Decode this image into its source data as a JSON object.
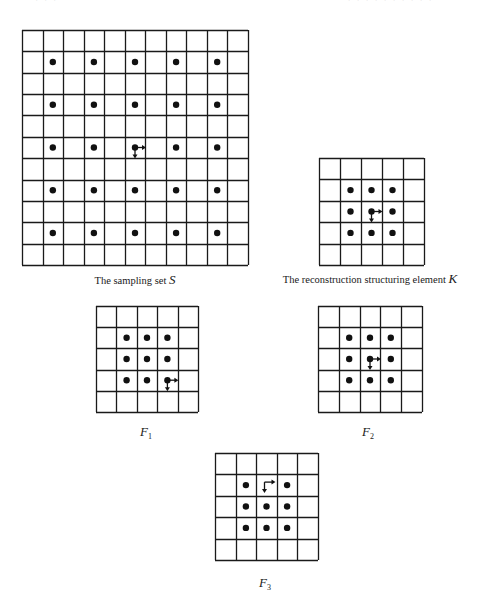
{
  "page_header": {
    "left_fragment": "· · ·",
    "right_fragment": "· · · · · · · · · ·"
  },
  "figures": [
    {
      "id": "S",
      "caption_text": "The sampling set ",
      "caption_symbol": "S",
      "caption_sub": "",
      "box": {
        "x": 22,
        "y": 30,
        "w": 226,
        "h": 235
      },
      "cols": 11,
      "rows": 11,
      "dots": [
        [
          1,
          1
        ],
        [
          1,
          3
        ],
        [
          1,
          5
        ],
        [
          1,
          7
        ],
        [
          1,
          9
        ],
        [
          3,
          1
        ],
        [
          3,
          3
        ],
        [
          3,
          5
        ],
        [
          3,
          7
        ],
        [
          3,
          9
        ],
        [
          5,
          1
        ],
        [
          5,
          3
        ],
        [
          5,
          7
        ],
        [
          5,
          9
        ],
        [
          7,
          1
        ],
        [
          7,
          3
        ],
        [
          7,
          5
        ],
        [
          7,
          7
        ],
        [
          7,
          9
        ],
        [
          9,
          1
        ],
        [
          9,
          3
        ],
        [
          9,
          5
        ],
        [
          9,
          7
        ],
        [
          9,
          9
        ]
      ],
      "origin": {
        "row": 5,
        "col": 5,
        "with_dot": true
      },
      "caption_pos": {
        "x": 135,
        "y": 272
      }
    },
    {
      "id": "K",
      "caption_text": "The reconstruction structuring element ",
      "caption_symbol": "K",
      "caption_sub": "",
      "box": {
        "x": 319,
        "y": 158,
        "w": 105,
        "h": 107
      },
      "cols": 5,
      "rows": 5,
      "dots": [
        [
          1,
          1
        ],
        [
          1,
          2
        ],
        [
          1,
          3
        ],
        [
          2,
          1
        ],
        [
          2,
          3
        ],
        [
          3,
          1
        ],
        [
          3,
          2
        ],
        [
          3,
          3
        ]
      ],
      "origin": {
        "row": 2,
        "col": 2,
        "with_dot": true
      },
      "caption_pos": {
        "x": 370,
        "y": 271
      }
    },
    {
      "id": "F1",
      "caption_text": "",
      "caption_symbol": "F",
      "caption_sub": "1",
      "box": {
        "x": 96,
        "y": 306,
        "w": 102,
        "h": 106
      },
      "cols": 5,
      "rows": 5,
      "dots": [
        [
          1,
          1
        ],
        [
          1,
          2
        ],
        [
          1,
          3
        ],
        [
          2,
          1
        ],
        [
          2,
          2
        ],
        [
          2,
          3
        ],
        [
          3,
          1
        ],
        [
          3,
          2
        ]
      ],
      "origin": {
        "row": 3,
        "col": 3,
        "with_dot": true
      },
      "caption_pos": {
        "x": 146,
        "y": 424
      }
    },
    {
      "id": "F2",
      "caption_text": "",
      "caption_symbol": "F",
      "caption_sub": "2",
      "box": {
        "x": 318,
        "y": 306,
        "w": 104,
        "h": 106
      },
      "cols": 5,
      "rows": 5,
      "dots": [
        [
          1,
          1
        ],
        [
          1,
          2
        ],
        [
          1,
          3
        ],
        [
          2,
          1
        ],
        [
          2,
          3
        ],
        [
          3,
          1
        ],
        [
          3,
          2
        ],
        [
          3,
          3
        ]
      ],
      "origin": {
        "row": 2,
        "col": 2,
        "with_dot": true
      },
      "caption_pos": {
        "x": 368,
        "y": 424
      }
    },
    {
      "id": "F3",
      "caption_text": "",
      "caption_symbol": "F",
      "caption_sub": "3",
      "box": {
        "x": 215,
        "y": 453,
        "w": 103,
        "h": 107
      },
      "cols": 5,
      "rows": 5,
      "dots": [
        [
          1,
          1
        ],
        [
          1,
          3
        ],
        [
          2,
          1
        ],
        [
          2,
          2
        ],
        [
          2,
          3
        ],
        [
          3,
          1
        ],
        [
          3,
          2
        ],
        [
          3,
          3
        ]
      ],
      "origin": {
        "row": 1,
        "col": 2,
        "with_dot": false
      },
      "caption_pos": {
        "x": 265,
        "y": 575
      }
    }
  ],
  "colors": {
    "grid_line": "#1a1a1a",
    "dot": "#111111",
    "background": "#ffffff"
  }
}
